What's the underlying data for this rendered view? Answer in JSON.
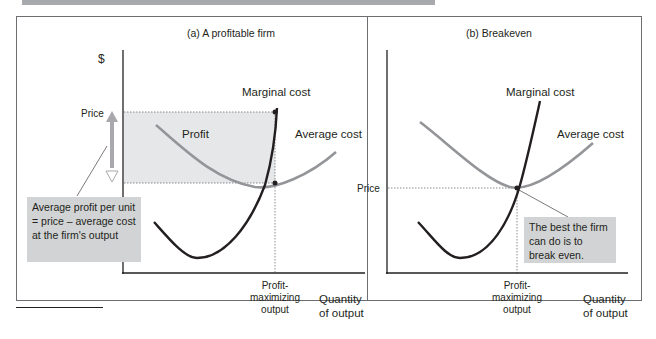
{
  "panels": [
    {
      "title": "(a) A profitable firm",
      "y_axis_label": "$",
      "price_label": "Price",
      "region_label": "Profit",
      "curves": {
        "marginal_cost": "Marginal cost",
        "average_cost": "Average cost"
      },
      "x_marker": "Profit-\nmaximizing\noutput",
      "x_marker_lines": [
        "Profit-",
        "maximizing",
        "output"
      ],
      "x_axis_label_lines": [
        "Quantity",
        "of output"
      ],
      "callout": "Average profit per unit = price – average cost at the firm's output"
    },
    {
      "title": "(b) Breakeven",
      "price_label": "Price",
      "curves": {
        "marginal_cost": "Marginal cost",
        "average_cost": "Average cost"
      },
      "x_marker_lines": [
        "Profit-",
        "maximizing",
        "output"
      ],
      "x_axis_label_lines": [
        "Quantity",
        "of output"
      ],
      "callout": "The best the firm can do is to break even."
    }
  ],
  "colors": {
    "marginal_cost": "#231f20",
    "average_cost": "#939598",
    "profit_area": "#e6e7e8",
    "callout_bg": "#d1d3d4",
    "arrow": "#a7a9ac"
  }
}
